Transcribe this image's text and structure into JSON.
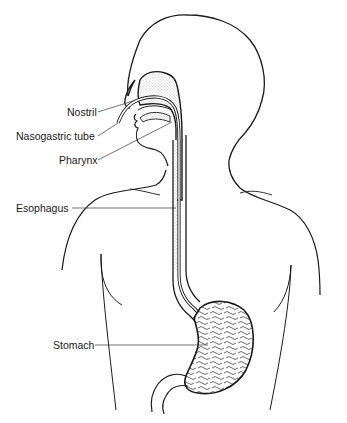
{
  "diagram": {
    "labels": [
      {
        "id": "nostril",
        "text": "Nostril"
      },
      {
        "id": "nasogastric-tube",
        "text": "Nasogastric tube"
      },
      {
        "id": "pharynx",
        "text": "Pharynx"
      },
      {
        "id": "esophagus",
        "text": "Esophagus"
      },
      {
        "id": "stomach",
        "text": "Stomach"
      }
    ],
    "colors": {
      "line": "#1a1a1a",
      "stipple": "#b0b0b0",
      "background": "#ffffff"
    }
  }
}
